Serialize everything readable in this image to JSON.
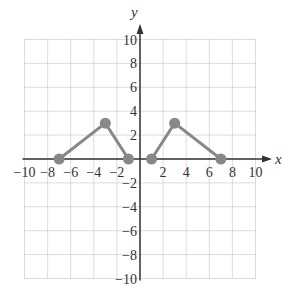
{
  "chart_data": {
    "type": "line",
    "title": "",
    "xlabel": "x",
    "ylabel": "y",
    "xlim": [
      -10,
      10
    ],
    "ylim": [
      -10,
      10
    ],
    "grid": true,
    "x_tick_labels": [
      "-10",
      "-8",
      "-6",
      "-4",
      "-2",
      "2",
      "4",
      "6",
      "8",
      "10"
    ],
    "y_tick_labels": [
      "10",
      "8",
      "6",
      "4",
      "2",
      "-2",
      "-4",
      "-6",
      "-8",
      "-10"
    ],
    "series": [
      {
        "name": "left-triangle",
        "points": [
          [
            -7,
            0
          ],
          [
            -3,
            3
          ],
          [
            -1,
            0
          ]
        ]
      },
      {
        "name": "right-triangle",
        "points": [
          [
            1,
            0
          ],
          [
            3,
            3
          ],
          [
            7,
            0
          ]
        ]
      }
    ],
    "colors": {
      "series": "#888888",
      "axis": "#333333",
      "grid": "#bbbbbb"
    }
  }
}
